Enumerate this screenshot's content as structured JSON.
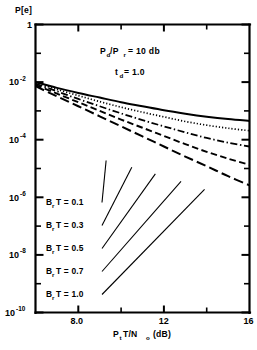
{
  "chart_data": {
    "type": "line",
    "title": "",
    "xlabel": "P T/N  (dB)",
    "xlabel_parts": {
      "main1": "P",
      "sub1": "t",
      "main2": "T/N",
      "sub2": "o",
      "main3": "(dB)"
    },
    "ylabel": "P[e]",
    "xlim": [
      6,
      16
    ],
    "ylim": [
      1e-10,
      1
    ],
    "yscale": "log",
    "grid": false,
    "legend_position": "inside-left",
    "annotations": [
      {
        "text": "P /P  = 10 db",
        "parts": {
          "p1": "P",
          "s1": "d",
          "p2": "/P",
          "s2": "r",
          "p3": "= 10 db"
        }
      },
      {
        "text": "t  = 1.0",
        "parts": {
          "p1": "t",
          "s1": "d",
          "p2": "= 1.0"
        }
      }
    ],
    "xticks": [
      {
        "value": 6,
        "label": ""
      },
      {
        "value": 8,
        "label": "8.0"
      },
      {
        "value": 10,
        "label": ""
      },
      {
        "value": 12,
        "label": "12"
      },
      {
        "value": 14,
        "label": ""
      },
      {
        "value": 16,
        "label": "16"
      }
    ],
    "yticks": [
      {
        "exp": 0,
        "label": "1",
        "mantissa": "1",
        "exponent": ""
      },
      {
        "exp": -1,
        "label": "",
        "mantissa": "",
        "exponent": ""
      },
      {
        "exp": -2,
        "label": "10",
        "mantissa": "10",
        "exponent": "-2"
      },
      {
        "exp": -3,
        "label": "",
        "mantissa": "",
        "exponent": ""
      },
      {
        "exp": -4,
        "label": "10",
        "mantissa": "10",
        "exponent": "-4"
      },
      {
        "exp": -5,
        "label": "",
        "mantissa": "",
        "exponent": ""
      },
      {
        "exp": -6,
        "label": "10",
        "mantissa": "10",
        "exponent": "-6"
      },
      {
        "exp": -7,
        "label": "",
        "mantissa": "",
        "exponent": ""
      },
      {
        "exp": -8,
        "label": "10",
        "mantissa": "10",
        "exponent": "-8"
      },
      {
        "exp": -9,
        "label": "",
        "mantissa": "",
        "exponent": ""
      },
      {
        "exp": -10,
        "label": "10",
        "mantissa": "10",
        "exponent": "-10"
      }
    ],
    "series": [
      {
        "name": "B T = 0.1",
        "name_parts": {
          "p1": "B",
          "s1": "r",
          "p2": "T = 0.1"
        },
        "value": 0.1,
        "style": "solid",
        "x": [
          6,
          7,
          8,
          9,
          10,
          11,
          12,
          13,
          14,
          15,
          16
        ],
        "y": [
          0.01,
          0.0063,
          0.0042,
          0.0029,
          0.002,
          0.00145,
          0.00105,
          0.0008,
          0.00063,
          0.00052,
          0.00045
        ]
      },
      {
        "name": "B T = 0.3",
        "name_parts": {
          "p1": "B",
          "s1": "r",
          "p2": "T = 0.3"
        },
        "value": 0.3,
        "style": "dotted",
        "x": [
          6,
          7,
          8,
          9,
          10,
          11,
          12,
          13,
          14,
          15,
          16
        ],
        "y": [
          0.0095,
          0.0056,
          0.0034,
          0.0021,
          0.00135,
          0.0009,
          0.00062,
          0.00043,
          0.00032,
          0.00025,
          0.000205
        ]
      },
      {
        "name": "B T = 0.5",
        "name_parts": {
          "p1": "B",
          "s1": "r",
          "p2": "T = 0.5"
        },
        "value": 0.5,
        "style": "dashdot",
        "x": [
          6,
          7,
          8,
          9,
          10,
          11,
          12,
          13,
          14,
          15,
          16
        ],
        "y": [
          0.0088,
          0.0048,
          0.0026,
          0.00145,
          0.00082,
          0.00048,
          0.00029,
          0.00018,
          0.000115,
          7.9e-05,
          5.8e-05
        ]
      },
      {
        "name": "B T = 0.7",
        "name_parts": {
          "p1": "B",
          "s1": "r",
          "p2": "T = 0.7"
        },
        "value": 0.7,
        "style": "dash",
        "x": [
          6,
          7,
          8,
          9,
          10,
          11,
          12,
          13,
          14,
          15,
          16
        ],
        "y": [
          0.008,
          0.004,
          0.002,
          0.001,
          0.0005,
          0.00026,
          0.000135,
          7e-05,
          3.8e-05,
          2.2e-05,
          1.35e-05
        ]
      },
      {
        "name": "B T = 1.0",
        "name_parts": {
          "p1": "B",
          "s1": "r",
          "p2": "T = 1.0"
        },
        "value": 1.0,
        "style": "longdash",
        "x": [
          6,
          7,
          8,
          9,
          10,
          11,
          12,
          13,
          14,
          15,
          16
        ],
        "y": [
          0.0072,
          0.0032,
          0.00145,
          0.00065,
          0.00029,
          0.00013,
          5.8e-05,
          2.6e-05,
          1.2e-05,
          5.4e-06,
          2.6e-06
        ]
      }
    ],
    "legend_entries": [
      {
        "label": "B T = 0.1",
        "anchor_x": 9.3,
        "anchor_y": 1.9e-05
      },
      {
        "label": "B T = 0.3",
        "anchor_x": 10.5,
        "anchor_y": 1.1e-05
      },
      {
        "label": "B T = 0.5",
        "anchor_x": 11.6,
        "anchor_y": 6.5e-06
      },
      {
        "label": "B T = 0.7",
        "anchor_x": 12.8,
        "anchor_y": 3.6e-06
      },
      {
        "label": "B T = 1.0",
        "anchor_x": 13.9,
        "anchor_y": 1.9e-06
      }
    ]
  }
}
